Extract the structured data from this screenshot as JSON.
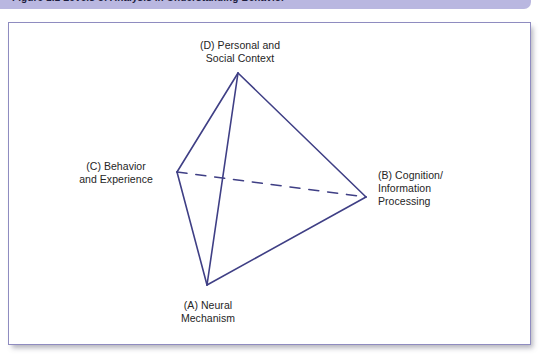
{
  "caption": {
    "text": "Figure 1.1   Levels of Analysis in Understanding Behavior"
  },
  "figure": {
    "shape": "tetrahedron",
    "line_color": "#3f3f85",
    "frame_border_color": "#8f8cc0",
    "background_color": "#ffffff",
    "caption_bar_color": "#b9b7e0",
    "label_color": "#252525"
  },
  "vertices": {
    "d": {
      "key": "(D)",
      "label": "(D) Personal and\nSocial Context",
      "x": 238,
      "y": 73
    },
    "c": {
      "key": "(C)",
      "label": "(C) Behavior\nand Experience",
      "x": 177,
      "y": 172
    },
    "b": {
      "key": "(B)",
      "label": "(B) Cognition/\nInformation\nProcessing",
      "x": 366,
      "y": 197
    },
    "a": {
      "key": "(A)",
      "label": "(A) Neural\nMechanism",
      "x": 207,
      "y": 285
    }
  },
  "edges": [
    {
      "name": "d-c",
      "from": "d",
      "to": "c",
      "style": "solid"
    },
    {
      "name": "d-a",
      "from": "d",
      "to": "a",
      "style": "solid"
    },
    {
      "name": "d-b",
      "from": "d",
      "to": "b",
      "style": "solid"
    },
    {
      "name": "c-a",
      "from": "c",
      "to": "a",
      "style": "solid"
    },
    {
      "name": "a-b",
      "from": "a",
      "to": "b",
      "style": "solid"
    },
    {
      "name": "c-b",
      "from": "c",
      "to": "b",
      "style": "dashed"
    }
  ]
}
